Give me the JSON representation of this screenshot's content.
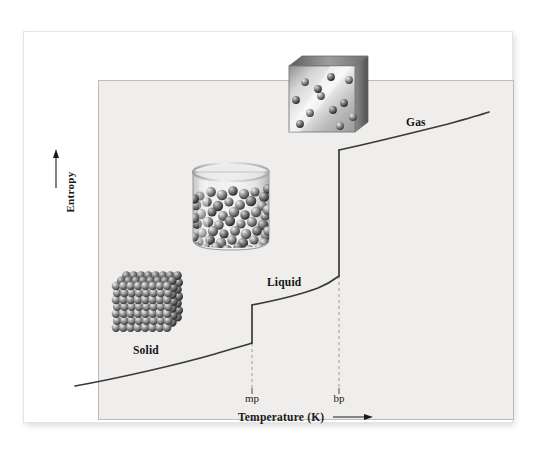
{
  "figure": {
    "background_color": "#ffffff",
    "plot_background_color": "#efeeec",
    "curve_color": "#3a3a3a",
    "frame_color": "#bdbcba"
  },
  "axes": {
    "y_title": "Entropy",
    "y_arrow": "upward-arrow",
    "x_title": "Temperature (K)",
    "x_arrow": "rightward-arrow"
  },
  "ticks": [
    {
      "id": "mp",
      "label": "mp",
      "meaning": "melting point"
    },
    {
      "id": "bp",
      "label": "bp",
      "meaning": "boiling point"
    }
  ],
  "phase_labels": [
    {
      "id": "solid",
      "label": "Solid"
    },
    {
      "id": "liquid",
      "label": "Liquid"
    },
    {
      "id": "gas",
      "label": "Gas"
    }
  ],
  "illustrations": [
    {
      "id": "solid",
      "name": "crystal-lattice-cube",
      "description": "ordered cubic array of close-packed spheres"
    },
    {
      "id": "liquid",
      "name": "beaker-of-liquid",
      "description": "cylindrical beaker partly filled with randomly packed spheres"
    },
    {
      "id": "gas",
      "name": "gas-filled-container",
      "description": "transparent cube with widely separated spheres"
    }
  ],
  "chart_data": {
    "type": "line",
    "title": "",
    "xlabel": "Temperature (K)",
    "ylabel": "Entropy",
    "grid": false,
    "legend": "none",
    "xlim": [
      0,
      100
    ],
    "ylim": [
      0,
      100
    ],
    "xticks": [
      42,
      67
    ],
    "xticklabels": [
      "mp",
      "bp"
    ],
    "yticks": [],
    "yticklabels": [],
    "annotations": [
      {
        "text": "Solid",
        "x": 16,
        "y": 17
      },
      {
        "text": "Liquid",
        "x": 49,
        "y": 37
      },
      {
        "text": "Gas",
        "x": 82,
        "y": 83
      }
    ],
    "series": [
      {
        "name": "Solid branch",
        "phase": "solid",
        "x": [
          0,
          6,
          13,
          21,
          29,
          36,
          42
        ],
        "y": [
          1,
          4,
          8,
          12,
          16,
          20,
          25
        ]
      },
      {
        "name": "Melting transition (fusion entropy jump)",
        "phase": "solid-to-liquid",
        "x": [
          42,
          42
        ],
        "y": [
          25,
          36
        ],
        "vertical_jump": 11
      },
      {
        "name": "Liquid branch",
        "phase": "liquid",
        "x": [
          42,
          49,
          56,
          62,
          67
        ],
        "y": [
          36,
          38,
          41,
          45,
          50
        ],
        "_note": "shallow rise then steepening near bp"
      },
      {
        "name": "Vaporization transition (entropy jump)",
        "phase": "liquid-to-gas",
        "x": [
          67,
          67
        ],
        "y": [
          50,
          87
        ],
        "vertical_jump": 37
      },
      {
        "name": "Gas branch",
        "phase": "gas",
        "x": [
          67,
          75,
          83,
          91,
          100
        ],
        "y": [
          87,
          90,
          93,
          96,
          99
        ]
      }
    ]
  }
}
